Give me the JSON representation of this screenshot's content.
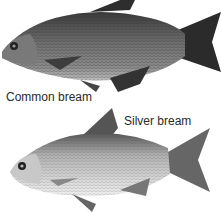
{
  "figure": {
    "panels": [
      {
        "label": "Common bream",
        "description": "Photograph of a deep-bodied, bronze-grey fish facing left"
      },
      {
        "label": "Silver bream",
        "description": "Photograph of a silvery, deep-bodied fish facing left"
      }
    ]
  }
}
